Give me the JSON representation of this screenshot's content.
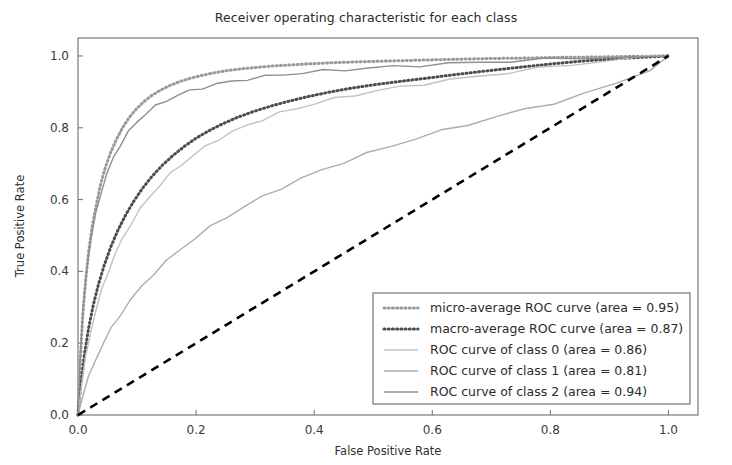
{
  "chart_data": {
    "type": "line",
    "title": "Receiver operating characteristic for each class",
    "xlabel": "False Positive Rate",
    "ylabel": "True Positive Rate",
    "xlim": [
      0.0,
      1.05
    ],
    "ylim": [
      0.0,
      1.05
    ],
    "grid": false,
    "legend_position": "lower right",
    "xticks": [
      "0.0",
      "0.2",
      "0.4",
      "0.6",
      "0.8",
      "1.0"
    ],
    "xtick_values": [
      0.0,
      0.2,
      0.4,
      0.6,
      0.8,
      1.0
    ],
    "yticks": [
      "0.0",
      "0.2",
      "0.4",
      "0.6",
      "0.8",
      "1.0"
    ],
    "ytick_values": [
      0.0,
      0.2,
      0.4,
      0.6,
      0.8,
      1.0
    ],
    "series": [
      {
        "name": "micro-average ROC curve (area = 0.95)",
        "legend_label": "micro-average ROC curve (area = 0.95)",
        "area": 0.95,
        "style": "dotted",
        "color": "#9a9a9a",
        "linewidth": 3,
        "x": [
          0.0,
          0.004,
          0.008,
          0.013,
          0.018,
          0.024,
          0.031,
          0.038,
          0.046,
          0.055,
          0.065,
          0.075,
          0.086,
          0.098,
          0.111,
          0.125,
          0.14,
          0.156,
          0.173,
          0.191,
          0.21,
          0.23,
          0.252,
          0.276,
          0.302,
          0.33,
          0.36,
          0.393,
          0.428,
          0.466,
          0.507,
          0.551,
          0.598,
          0.648,
          0.701,
          0.757,
          0.816,
          0.878,
          0.94,
          1.0
        ],
        "y": [
          0.0,
          0.155,
          0.275,
          0.375,
          0.455,
          0.525,
          0.585,
          0.64,
          0.688,
          0.73,
          0.767,
          0.799,
          0.827,
          0.851,
          0.872,
          0.89,
          0.905,
          0.918,
          0.929,
          0.938,
          0.946,
          0.953,
          0.959,
          0.964,
          0.968,
          0.972,
          0.975,
          0.978,
          0.981,
          0.983,
          0.985,
          0.987,
          0.989,
          0.991,
          0.993,
          0.994,
          0.996,
          0.997,
          0.999,
          1.0
        ]
      },
      {
        "name": "macro-average ROC curve (area = 0.87)",
        "legend_label": "macro-average ROC curve (area = 0.87)",
        "area": 0.87,
        "style": "dotted",
        "color": "#4d4d4d",
        "linewidth": 3,
        "x": [
          0.0,
          0.005,
          0.011,
          0.018,
          0.026,
          0.035,
          0.045,
          0.056,
          0.068,
          0.081,
          0.095,
          0.11,
          0.126,
          0.143,
          0.161,
          0.18,
          0.2,
          0.222,
          0.245,
          0.27,
          0.297,
          0.326,
          0.357,
          0.39,
          0.425,
          0.462,
          0.502,
          0.545,
          0.59,
          0.638,
          0.69,
          0.745,
          0.803,
          0.864,
          0.93,
          1.0
        ],
        "y": [
          0.0,
          0.09,
          0.17,
          0.242,
          0.307,
          0.366,
          0.42,
          0.47,
          0.516,
          0.558,
          0.597,
          0.633,
          0.666,
          0.696,
          0.723,
          0.748,
          0.771,
          0.792,
          0.811,
          0.829,
          0.845,
          0.86,
          0.874,
          0.887,
          0.899,
          0.91,
          0.92,
          0.929,
          0.938,
          0.948,
          0.958,
          0.968,
          0.978,
          0.987,
          0.994,
          1.0
        ]
      },
      {
        "name": "ROC curve of class 0 (area = 0.86)",
        "legend_label": "ROC curve of class 0 (area = 0.86)",
        "area": 0.86,
        "style": "solid",
        "color": "#c2c2c2",
        "linewidth": 1.4,
        "x": [
          0.0,
          0.006,
          0.013,
          0.021,
          0.03,
          0.04,
          0.051,
          0.063,
          0.076,
          0.09,
          0.105,
          0.121,
          0.138,
          0.156,
          0.175,
          0.195,
          0.216,
          0.238,
          0.262,
          0.287,
          0.313,
          0.341,
          0.37,
          0.401,
          0.434,
          0.469,
          0.506,
          0.545,
          0.586,
          0.63,
          0.677,
          0.727,
          0.78,
          0.836,
          0.896,
          0.96,
          1.0
        ],
        "y": [
          0.0,
          0.085,
          0.16,
          0.228,
          0.29,
          0.347,
          0.4,
          0.448,
          0.493,
          0.534,
          0.572,
          0.607,
          0.64,
          0.67,
          0.698,
          0.723,
          0.747,
          0.769,
          0.789,
          0.807,
          0.824,
          0.84,
          0.854,
          0.868,
          0.88,
          0.892,
          0.903,
          0.913,
          0.923,
          0.933,
          0.943,
          0.954,
          0.965,
          0.976,
          0.987,
          0.996,
          1.0
        ]
      },
      {
        "name": "ROC curve of class 1 (area = 0.81)",
        "legend_label": "ROC curve of class 1 (area = 0.81)",
        "area": 0.81,
        "style": "solid",
        "color": "#adadad",
        "linewidth": 1.4,
        "x": [
          0.0,
          0.008,
          0.018,
          0.029,
          0.042,
          0.056,
          0.072,
          0.089,
          0.108,
          0.128,
          0.15,
          0.173,
          0.198,
          0.224,
          0.252,
          0.281,
          0.312,
          0.344,
          0.378,
          0.413,
          0.45,
          0.489,
          0.529,
          0.571,
          0.615,
          0.66,
          0.707,
          0.756,
          0.806,
          0.858,
          0.912,
          0.968,
          1.0
        ],
        "y": [
          0.0,
          0.055,
          0.105,
          0.152,
          0.197,
          0.24,
          0.281,
          0.32,
          0.358,
          0.394,
          0.428,
          0.461,
          0.493,
          0.523,
          0.552,
          0.58,
          0.607,
          0.633,
          0.658,
          0.682,
          0.705,
          0.727,
          0.749,
          0.77,
          0.79,
          0.81,
          0.83,
          0.85,
          0.87,
          0.894,
          0.924,
          0.962,
          1.0
        ]
      },
      {
        "name": "ROC curve of class 2 (area = 0.94)",
        "legend_label": "ROC curve of class 2 (area = 0.94)",
        "area": 0.94,
        "style": "solid",
        "color": "#8f8f8f",
        "linewidth": 1.4,
        "x": [
          0.0,
          0.004,
          0.009,
          0.015,
          0.022,
          0.03,
          0.039,
          0.049,
          0.06,
          0.072,
          0.085,
          0.099,
          0.114,
          0.131,
          0.149,
          0.168,
          0.189,
          0.211,
          0.235,
          0.26,
          0.287,
          0.316,
          0.347,
          0.38,
          0.415,
          0.452,
          0.492,
          0.534,
          0.579,
          0.627,
          0.678,
          0.732,
          0.79,
          0.852,
          0.918,
          1.0
        ],
        "y": [
          0.0,
          0.175,
          0.305,
          0.41,
          0.49,
          0.56,
          0.62,
          0.672,
          0.716,
          0.754,
          0.787,
          0.815,
          0.839,
          0.859,
          0.876,
          0.89,
          0.902,
          0.912,
          0.921,
          0.929,
          0.936,
          0.942,
          0.948,
          0.953,
          0.958,
          0.962,
          0.966,
          0.97,
          0.974,
          0.978,
          0.982,
          0.986,
          0.99,
          0.994,
          0.997,
          1.0
        ]
      }
    ],
    "reference_line": {
      "name": "chance-diagonal",
      "style": "dashed",
      "color": "#000000",
      "linewidth": 2.6,
      "x": [
        0.0,
        1.0
      ],
      "y": [
        0.0,
        1.0
      ]
    }
  },
  "colors": {
    "background": "#ffffff",
    "axis": "#7a7a7a",
    "text": "#2b2b2b",
    "diagonal": "#000000"
  }
}
